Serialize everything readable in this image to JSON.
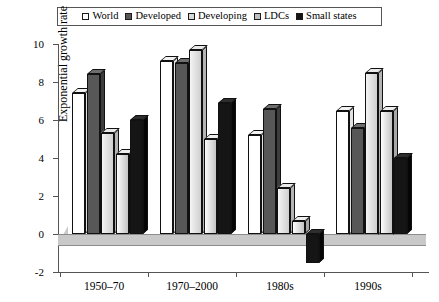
{
  "chart_data": {
    "type": "bar",
    "title": "",
    "xlabel": "",
    "ylabel": "Exponential growth rate",
    "ylim": [
      -2,
      10
    ],
    "yticks": [
      -2,
      0,
      2,
      4,
      6,
      8,
      10
    ],
    "ytick_labels": [
      "-2",
      "0",
      "2",
      "4",
      "6",
      "8",
      "10"
    ],
    "grid": false,
    "legend_position": "top",
    "categories": [
      "1950–70",
      "1970–2000",
      "1980s",
      "1990s"
    ],
    "series": [
      {
        "name": "World",
        "color": "#ffffff",
        "values": [
          7.4,
          9.1,
          5.2,
          6.5
        ]
      },
      {
        "name": "Developed",
        "color": "#575757",
        "values": [
          8.4,
          9.0,
          6.6,
          5.6
        ]
      },
      {
        "name": "Developing",
        "color": "#d9d9d9",
        "values": [
          5.3,
          9.7,
          2.4,
          8.5
        ]
      },
      {
        "name": "LDCs",
        "color": "#bfbfbf",
        "values": [
          4.2,
          5.0,
          0.7,
          6.5
        ]
      },
      {
        "name": "Small states",
        "color": "#151515",
        "values": [
          6.0,
          6.9,
          -1.5,
          4.0
        ]
      }
    ]
  },
  "legend": {
    "items": [
      {
        "label": "World",
        "swatch": "legend-swatch-world"
      },
      {
        "label": "Developed",
        "swatch": "legend-swatch-developed"
      },
      {
        "label": "Developing",
        "swatch": "legend-swatch-developing"
      },
      {
        "label": "LDCs",
        "swatch": "legend-swatch-ldcs"
      },
      {
        "label": "Small states",
        "swatch": "legend-swatch-small-states"
      }
    ]
  }
}
